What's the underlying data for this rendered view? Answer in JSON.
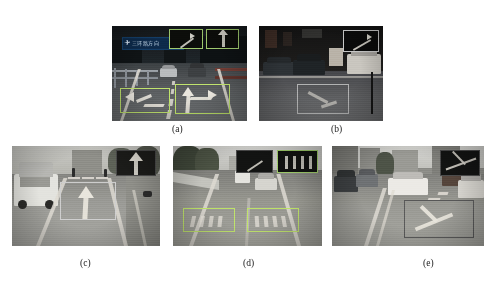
{
  "figure": {
    "type": "multi-panel-figure",
    "panel_count": 5,
    "background_color": "#ffffff",
    "box_color": "#bfe36a",
    "box_color_alt": "#cfcfcf"
  },
  "panels": [
    {
      "id": "a",
      "caption": "(a)",
      "scene": "elevated urban road at dusk with blue overhead direction sign, guardrail on the left and two cars ahead",
      "sign_text": "三环路方向",
      "detections": [
        {
          "name": "left-turn-arrow",
          "label": "curved left arrow road marking"
        },
        {
          "name": "straight-right-arrow",
          "label": "straight and right arrow road marking"
        }
      ],
      "insets": [
        {
          "name": "inset-left-turn-arrow"
        },
        {
          "name": "inset-straight-arrow"
        }
      ]
    },
    {
      "id": "b",
      "caption": "(b)",
      "scene": "night street with parked cars along a shop frontage and a truck at the right",
      "detections": [
        {
          "name": "turn-arrow-marking",
          "label": "road arrow marking on wet asphalt"
        }
      ],
      "insets": [
        {
          "name": "inset-turn-arrow"
        }
      ]
    },
    {
      "id": "c",
      "caption": "(c)",
      "scene": "daytime residential street with a white SUV parked at the left, pedestrian crossing ahead and a dog at the right",
      "detections": [
        {
          "name": "straight-arrow-marking",
          "label": "straight-ahead arrow road marking"
        }
      ],
      "insets": [
        {
          "name": "inset-straight-arrow"
        }
      ]
    },
    {
      "id": "d",
      "caption": "(d)",
      "scene": "multi-lane highway with a white van and a silver sedan ahead, trees lining the left shoulder",
      "detections": [
        {
          "name": "road-text-marking-left",
          "label": "painted road text in the left lane"
        },
        {
          "name": "road-text-marking-right",
          "label": "painted road text in the right lane"
        }
      ],
      "insets": [
        {
          "name": "inset-road-text-left"
        },
        {
          "name": "inset-road-text-right"
        }
      ]
    },
    {
      "id": "e",
      "caption": "(e)",
      "scene": "city intersection with a white car crossing, parked vehicles on both sides and tall buildings behind",
      "detections": [
        {
          "name": "crossing-x-marking",
          "label": "X-shaped crossing road marking"
        }
      ],
      "insets": [
        {
          "name": "inset-crossing-x"
        }
      ]
    }
  ]
}
